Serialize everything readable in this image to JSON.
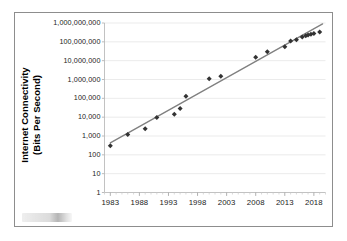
{
  "chart_data": {
    "type": "scatter",
    "title": "",
    "subtitle": "",
    "xlabel": "",
    "ylabel": "Internet Connectivity (Bits Per Second)",
    "ylabel_lines": [
      "Internet Connectivity",
      "(Bits Per Second)"
    ],
    "yscale": "log",
    "xscale": "linear",
    "grid": true,
    "grid_axis": "y",
    "legend": "none",
    "xlim": [
      1982,
      2020
    ],
    "ylim": [
      1,
      1000000000
    ],
    "xticks": [
      1983,
      1988,
      1993,
      1998,
      2003,
      2008,
      2013,
      2018
    ],
    "xtick_labels": [
      "1983",
      "1988",
      "1993",
      "1998",
      "2003",
      "2008",
      "2013",
      "2018"
    ],
    "xtick_minor_step": 1,
    "yticks": [
      1,
      10,
      100,
      1000,
      10000,
      100000,
      1000000,
      10000000,
      100000000,
      1000000000
    ],
    "ytick_labels": [
      "1",
      "10",
      "100",
      "1,000",
      "10,000",
      "100,000",
      "1,000,000",
      "10,000,000",
      "100,000,000",
      "1,000,000,000"
    ],
    "marker": "diamond",
    "marker_color": "#333333",
    "series": [
      {
        "name": "Internet connectivity speed",
        "points": [
          {
            "x": 1983,
            "y": 300
          },
          {
            "x": 1986,
            "y": 1200
          },
          {
            "x": 1989,
            "y": 2400
          },
          {
            "x": 1991,
            "y": 9600
          },
          {
            "x": 1994,
            "y": 14400
          },
          {
            "x": 1995,
            "y": 28800
          },
          {
            "x": 1996,
            "y": 128000
          },
          {
            "x": 2000,
            "y": 1100000
          },
          {
            "x": 2002,
            "y": 1500000
          },
          {
            "x": 2008,
            "y": 15000000
          },
          {
            "x": 2010,
            "y": 30000000
          },
          {
            "x": 2013,
            "y": 55000000
          },
          {
            "x": 2014,
            "y": 110000000
          },
          {
            "x": 2015,
            "y": 130000000
          },
          {
            "x": 2016,
            "y": 180000000
          },
          {
            "x": 2016.6,
            "y": 210000000
          },
          {
            "x": 2017,
            "y": 230000000
          },
          {
            "x": 2017.5,
            "y": 250000000
          },
          {
            "x": 2018,
            "y": 280000000
          },
          {
            "x": 2019,
            "y": 330000000
          }
        ]
      }
    ],
    "trendline": {
      "type": "linear-on-log",
      "color": "#808080",
      "from": {
        "x": 1983,
        "y": 430
      },
      "to": {
        "x": 2019.5,
        "y": 900000000
      }
    }
  },
  "figure": {
    "watermark_text": "",
    "border_color": "#8d8d8d",
    "background": "#ffffff"
  }
}
